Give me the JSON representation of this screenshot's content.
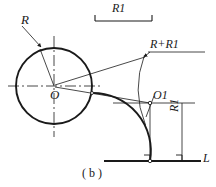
{
  "figure": {
    "caption": "( b )",
    "stroke_color": "#1a1a1a",
    "background_color": "#ffffff"
  },
  "labels": {
    "radius_R": "R",
    "dimension_R1_top": "R1",
    "sum_R_plus_R1": "R+R1",
    "center_O": "O",
    "center_O1": "O1",
    "dimension_R1_side": "R1",
    "line_L": "L"
  },
  "geometry": {
    "circle": {
      "cx": 54,
      "cy": 86,
      "r": 38
    },
    "center_O_point": {
      "x": 54,
      "y": 86
    },
    "center_O1_point": {
      "x": 150,
      "y": 103
    },
    "tangent_point_on_line": {
      "x": 150,
      "y": 161
    },
    "baseline_L": {
      "x1": 104,
      "y1": 161,
      "x2": 201,
      "y2": 161
    },
    "horizontal_centerline": {
      "x1": 8,
      "y1": 86,
      "x2": 101,
      "y2": 86
    },
    "vertical_centerline": {
      "x1": 54,
      "y1": 36,
      "x2": 54,
      "y2": 137
    },
    "top_dimension": {
      "x1": 95,
      "x2": 152,
      "y": 21
    },
    "side_dimension": {
      "x": 182,
      "y1": 103,
      "y2": 161
    },
    "fillet_arc_radius": 58,
    "construction_arc_radius": 96
  }
}
